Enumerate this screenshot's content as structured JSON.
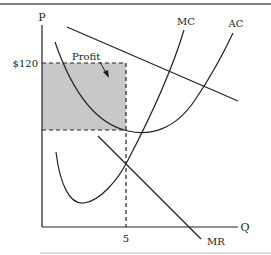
{
  "diagram": {
    "axis_labels": {
      "y": "P",
      "x": "Q"
    },
    "ticks": {
      "price": "$120",
      "quantity": "5"
    },
    "curves": {
      "mc": "MC",
      "ac": "AC",
      "mr": "MR",
      "demand": ""
    },
    "annotations": {
      "profit": "Profit"
    },
    "colors": {
      "line": "#222222",
      "shade": "#c8c8c8",
      "border": "#555555"
    }
  }
}
